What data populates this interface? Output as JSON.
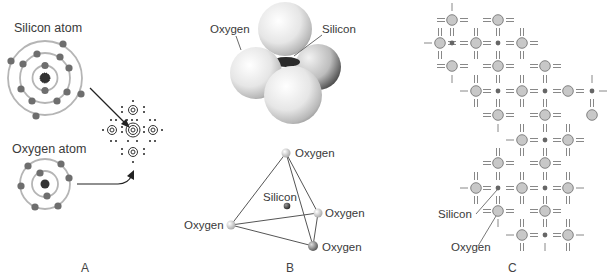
{
  "panels": {
    "a": {
      "letter": "A",
      "silicon_label": "Silicon atom",
      "oxygen_label": "Oxygen atom",
      "silicon_electrons": {
        "inner": 2,
        "middle": 8,
        "outer": 4
      },
      "oxygen_electrons": {
        "inner": 2,
        "outer": 6
      }
    },
    "b": {
      "letter": "B",
      "model_labels": {
        "oxygen": "Oxygen",
        "silicon": "Silicon"
      },
      "tetra_labels": {
        "top": "Oxygen",
        "silicon": "Silicon",
        "right": "Oxygen",
        "left": "Oxygen",
        "bottom": "Oxygen"
      }
    },
    "c": {
      "letter": "C",
      "labels": {
        "silicon": "Silicon",
        "oxygen": "Oxygen"
      }
    }
  },
  "colors": {
    "electron": "#6e6e6e",
    "orbit": "#b0b0b0",
    "oxygen_fill": "#c8c8c8",
    "silicon_fill": "#666666",
    "line": "#555555"
  }
}
